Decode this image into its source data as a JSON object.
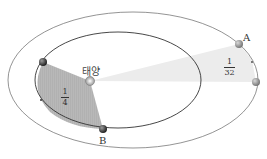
{
  "diagram": {
    "sun_label": "태양",
    "point_a_label": "A",
    "point_b_label": "B",
    "inner_sector_fraction": {
      "numerator": "1",
      "denominator": "4"
    },
    "outer_sector_fraction": {
      "numerator": "1",
      "denominator": "32"
    },
    "colors": {
      "inner_sector_fill": "#b4b4b4",
      "outer_sector_fill": "#ececec",
      "orbit_stroke": "#555555",
      "planet": "#3a3a3a"
    }
  }
}
